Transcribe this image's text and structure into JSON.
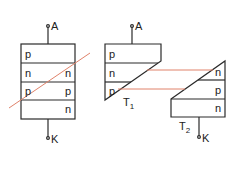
{
  "colors": {
    "stroke": "#2a2a2a",
    "cut_line": "#e0826a",
    "background": "#ffffff"
  },
  "left_device": {
    "anode_label": "A",
    "cathode_label": "K",
    "layers": [
      {
        "left": "p",
        "right": ""
      },
      {
        "left": "n",
        "right": "n"
      },
      {
        "left": "p",
        "right": "p"
      },
      {
        "left": "",
        "right": "n"
      }
    ]
  },
  "t1": {
    "name": "T",
    "subscript": "1",
    "anode_label": "A",
    "layers": [
      "p",
      "n",
      "p"
    ]
  },
  "t2": {
    "name": "T",
    "subscript": "2",
    "cathode_label": "K",
    "layers": [
      "n",
      "p",
      "n"
    ]
  }
}
